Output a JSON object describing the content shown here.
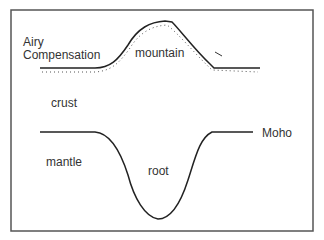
{
  "diagram": {
    "title_line1": "Airy",
    "title_line2": "Compensation",
    "labels": {
      "mountain": "mountain",
      "crust": "crust",
      "mantle": "mantle",
      "root": "root",
      "moho": "Moho"
    },
    "colors": {
      "line": "#333333",
      "frame": "#555555",
      "text": "#333333"
    }
  }
}
